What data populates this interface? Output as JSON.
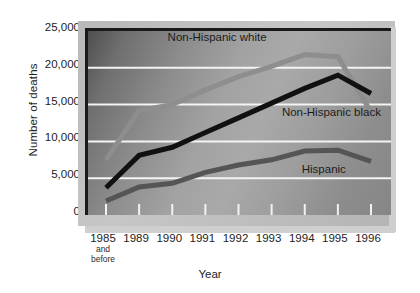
{
  "chart_data": {
    "type": "line",
    "title": "",
    "subtitle": "",
    "xlabel": "Year",
    "ylabel": "Number of deaths",
    "categories": [
      "1985",
      "1989",
      "1990",
      "1991",
      "1992",
      "1993",
      "1994",
      "1995",
      "1996"
    ],
    "category_sublabels": [
      "and before",
      "",
      "",
      "",
      "",
      "",
      "",
      "",
      ""
    ],
    "ylim": [
      0,
      25000
    ],
    "ytick_values": [
      0,
      5000,
      10000,
      15000,
      20000,
      25000
    ],
    "ytick_labels": [
      "0",
      "5,000",
      "10,000",
      "15,000",
      "20,000",
      "25,000"
    ],
    "grid": "horizontal-white",
    "legend_position": "inline-annotations",
    "series": [
      {
        "name": "Non-Hispanic white",
        "color": "#8e8e8e",
        "values": [
          7500,
          14200,
          15000,
          17000,
          18800,
          20200,
          21800,
          21500,
          14000
        ]
      },
      {
        "name": "Non-Hispanic black",
        "color": "#111111",
        "values": [
          3700,
          8100,
          9200,
          11200,
          13200,
          15200,
          17200,
          19000,
          16500
        ]
      },
      {
        "name": "Hispanic",
        "color": "#555555",
        "values": [
          1900,
          3800,
          4300,
          5800,
          6800,
          7500,
          8700,
          8800,
          7300
        ]
      }
    ],
    "annotations": [
      {
        "text": "Non-Hispanic white",
        "x": 1.95,
        "y": 23600
      },
      {
        "text": "Non-Hispanic black",
        "x": 5.4,
        "y": 13500
      },
      {
        "text": "Hispanic",
        "x": 6.0,
        "y": 5700
      }
    ]
  },
  "axes": {
    "ylabel": "Number of deaths",
    "xlabel": "Year"
  }
}
